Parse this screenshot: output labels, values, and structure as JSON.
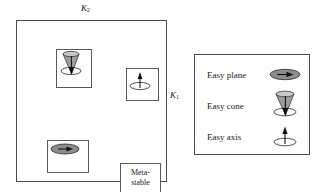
{
  "figure": {
    "type": "phase-diagram",
    "axes": {
      "vertical": {
        "symbol": "K",
        "subscript": "2",
        "label": "K2",
        "position": "top-center"
      },
      "horizontal": {
        "symbol": "K",
        "subscript": "1",
        "label": "K1",
        "position": "right-middle"
      }
    },
    "regions": [
      {
        "name": "upper-left-easy-cone",
        "quadrant": "K1<0, K2>0",
        "fill": "#9a9a9a",
        "icon": "easy-cone-icon"
      },
      {
        "name": "upper-left-easy-plane-white",
        "quadrant": "K1<0, K2>0 lower wedge",
        "fill": "#ffffff"
      },
      {
        "name": "upper-right-easy-axis",
        "quadrant": "K1>0, K2>0",
        "fill": "#777777",
        "icon": "easy-axis-icon"
      },
      {
        "name": "lower-left-easy-plane",
        "quadrant": "K1<0, K2<0",
        "fill": "#ffffff",
        "icon": "easy-plane-icon"
      },
      {
        "name": "lower-right-metastable",
        "quadrant": "K1>0, K2<0",
        "fill": "#d8d8d8",
        "label": "Meta-stable"
      },
      {
        "name": "lower-right-easy-axis-wedge",
        "quadrant": "K1>0, K2<0 upper wedge",
        "fill": "#777777"
      }
    ],
    "insets": [
      {
        "name": "inset-easy-cone",
        "icon": "easy-cone-icon"
      },
      {
        "name": "inset-easy-axis",
        "icon": "easy-axis-icon"
      },
      {
        "name": "inset-easy-plane",
        "icon": "easy-plane-icon"
      },
      {
        "name": "inset-metastable",
        "text_line1": "Meta-",
        "text_line2": "stable"
      }
    ]
  },
  "metastable": {
    "line1": "Meta-",
    "line2": "stable"
  },
  "legend": {
    "items": [
      {
        "label": "Easy plane",
        "icon": "easy-plane-icon"
      },
      {
        "label": "Easy cone",
        "icon": "easy-cone-icon"
      },
      {
        "label": "Easy axis",
        "icon": "easy-axis-icon"
      }
    ]
  },
  "colors": {
    "dark_gray": "#777777",
    "medium_gray": "#9a9a9a",
    "light_gray": "#d8d8d8",
    "white": "#ffffff",
    "line": "#4a4a4a",
    "icon_fill": "#8d8d8d"
  }
}
